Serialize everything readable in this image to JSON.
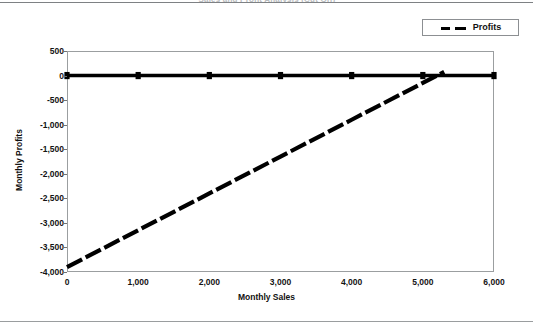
{
  "page": {
    "title_ghost": "Sales and Profit Analysis (Cut Off)"
  },
  "legend": {
    "position": "top-right",
    "entries": [
      {
        "label": "Profits",
        "style": "dashed",
        "color": "#000000"
      }
    ]
  },
  "axis": {
    "x_label": "Monthly Sales",
    "y_label": "Monthly Profits",
    "x_ticks": [
      "0",
      "1,000",
      "2,000",
      "3,000",
      "4,000",
      "5,000",
      "6,000"
    ],
    "y_ticks": [
      "500",
      "0",
      "-500",
      "-1,000",
      "-1,500",
      "-2,000",
      "-2,500",
      "-3,000",
      "-3,500",
      "-4,000"
    ]
  },
  "chart_data": {
    "type": "line",
    "title": "",
    "xlabel": "Monthly Sales",
    "ylabel": "Monthly Profits",
    "xlim": [
      0,
      6000
    ],
    "ylim": [
      -4000,
      500
    ],
    "xticks": [
      0,
      1000,
      2000,
      3000,
      4000,
      5000,
      6000
    ],
    "yticks": [
      500,
      0,
      -500,
      -1000,
      -1500,
      -2000,
      -2500,
      -3000,
      -3500,
      -4000
    ],
    "grid": false,
    "legend_position": "top-right",
    "breakeven_sales": 5200,
    "series": [
      {
        "name": "Zero Reference",
        "style": "solid",
        "color": "#000000",
        "marker": "square",
        "in_legend": false,
        "x": [
          0,
          1000,
          2000,
          3000,
          4000,
          5000,
          6000
        ],
        "values": [
          0,
          0,
          0,
          0,
          0,
          0,
          0
        ]
      },
      {
        "name": "Profits",
        "style": "dashed",
        "color": "#000000",
        "marker": "none",
        "in_legend": true,
        "x": [
          0,
          1000,
          2000,
          3000,
          4000,
          5000,
          5300
        ],
        "values": [
          -3900,
          -3150,
          -2400,
          -1650,
          -900,
          -150,
          75
        ]
      }
    ]
  }
}
